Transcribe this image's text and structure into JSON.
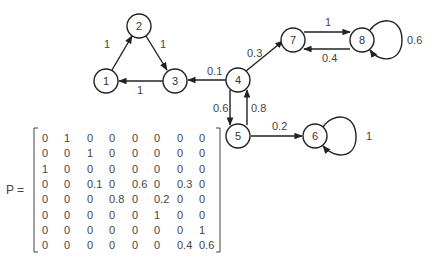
{
  "graph": {
    "nodes": [
      {
        "id": "1",
        "label": "1",
        "x": 106,
        "y": 81
      },
      {
        "id": "2",
        "label": "2",
        "x": 139,
        "y": 26
      },
      {
        "id": "3",
        "label": "3",
        "x": 175,
        "y": 81
      },
      {
        "id": "4",
        "label": "4",
        "x": 238,
        "y": 80
      },
      {
        "id": "5",
        "label": "5",
        "x": 238,
        "y": 135
      },
      {
        "id": "6",
        "label": "6",
        "x": 315,
        "y": 136
      },
      {
        "id": "7",
        "label": "7",
        "x": 294,
        "y": 40
      },
      {
        "id": "8",
        "label": "8",
        "x": 362,
        "y": 40
      }
    ],
    "edges": [
      {
        "from": "1",
        "to": "2",
        "label": "1"
      },
      {
        "from": "2",
        "to": "3",
        "label": "1"
      },
      {
        "from": "3",
        "to": "1",
        "label": "1"
      },
      {
        "from": "4",
        "to": "3",
        "label": "0.1"
      },
      {
        "from": "4",
        "to": "5",
        "label": "0.6"
      },
      {
        "from": "4",
        "to": "7",
        "label": "0.3"
      },
      {
        "from": "5",
        "to": "4",
        "label": "0.8"
      },
      {
        "from": "5",
        "to": "6",
        "label": "0.2"
      },
      {
        "from": "6",
        "to": "6",
        "label": "1"
      },
      {
        "from": "7",
        "to": "8",
        "label": "1"
      },
      {
        "from": "8",
        "to": "7",
        "label": "0.4"
      },
      {
        "from": "8",
        "to": "8",
        "label": "0.6"
      }
    ]
  },
  "matrix": {
    "label": "P =",
    "rows": [
      [
        "0",
        "1",
        "0",
        "0",
        "0",
        "0",
        "0",
        "0"
      ],
      [
        "0",
        "0",
        "1",
        "0",
        "0",
        "0",
        "0",
        "0"
      ],
      [
        "1",
        "0",
        "0",
        "0",
        "0",
        "0",
        "0",
        "0"
      ],
      [
        "0",
        "0",
        "0.1",
        "0",
        "0.6",
        "0",
        "0.3",
        "0"
      ],
      [
        "0",
        "0",
        "0",
        "0.8",
        "0",
        "0.2",
        "0",
        "0"
      ],
      [
        "0",
        "0",
        "0",
        "0",
        "0",
        "1",
        "0",
        "0"
      ],
      [
        "0",
        "0",
        "0",
        "0",
        "0",
        "0",
        "0",
        "1"
      ],
      [
        "0",
        "0",
        "0",
        "0",
        "0",
        "0",
        "0.4",
        "0.6"
      ]
    ]
  }
}
